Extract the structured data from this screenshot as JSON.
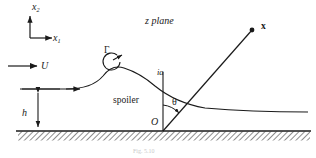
{
  "figure": {
    "title": "z plane",
    "caption": "Fig. 5.10",
    "colors": {
      "ink": "#1a1a1a",
      "ground_hatch": "#555555",
      "background": "#ffffff"
    }
  },
  "labels": {
    "axis_vertical": "x",
    "axis_vertical_sub": "2",
    "axis_horizontal": "x",
    "axis_horizontal_sub": "1",
    "freestream": "U",
    "plane": "z plane",
    "circulation": "Γ",
    "field_point": "x",
    "spoiler_tip": "ia",
    "spoiler": "spoiler",
    "angle": "θ",
    "origin": "O",
    "height": "h",
    "caption": "Fig. 5.10"
  },
  "geometry": {
    "ground_y": 131,
    "origin": {
      "x": 163,
      "y": 131
    },
    "spoiler_tip": {
      "x": 163,
      "y": 78
    },
    "ray_end": {
      "x": 252,
      "y": 30
    },
    "vortex_center": {
      "x": 112,
      "y": 62
    },
    "height_arrow": {
      "x": 38,
      "top": 88,
      "bottom": 131
    },
    "angle_degrees": "θ"
  }
}
